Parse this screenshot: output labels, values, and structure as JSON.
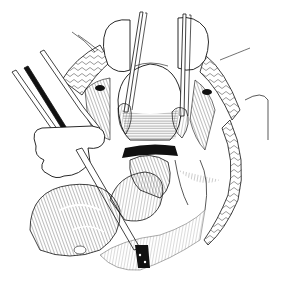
{
  "image": {
    "kind": "surgical-line-illustration",
    "width": 283,
    "height": 287,
    "background": "#ffffff",
    "ink": "#111111",
    "elements": [
      "retractor-left",
      "retractor-right",
      "forceps-left",
      "forceps-right",
      "surgical-instrument-left",
      "uterus",
      "bowel-loops",
      "tissue-right",
      "tissue-left",
      "gloved-hand"
    ]
  }
}
